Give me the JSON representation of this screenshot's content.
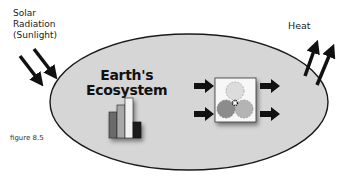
{
  "labels": {
    "solar_line1": "Solar",
    "solar_line2": "Radiation",
    "solar_line3": "(Sunlight)",
    "heat": "Heat",
    "title_line1": "Earth's",
    "title_line2": "Ecosystem",
    "figure": "figure 8.5"
  },
  "icons": {
    "bar_chart": "bar-chart-icon",
    "gears": "gears-icon",
    "arrow": "arrow-icon"
  },
  "colors": {
    "ellipse_fill": "#d6d6d6",
    "ellipse_stroke": "#1a1a1a",
    "bar_dark": "#6b6b6b",
    "bar_mid": "#a8a8a8",
    "bar_light": "#f2f2f2",
    "bar_black": "#1c1c1c",
    "gear_light": "#dcdcdc",
    "gear_dark": "#8c8c8c",
    "gear_mid": "#b4b4b4",
    "arrow": "#111111"
  }
}
